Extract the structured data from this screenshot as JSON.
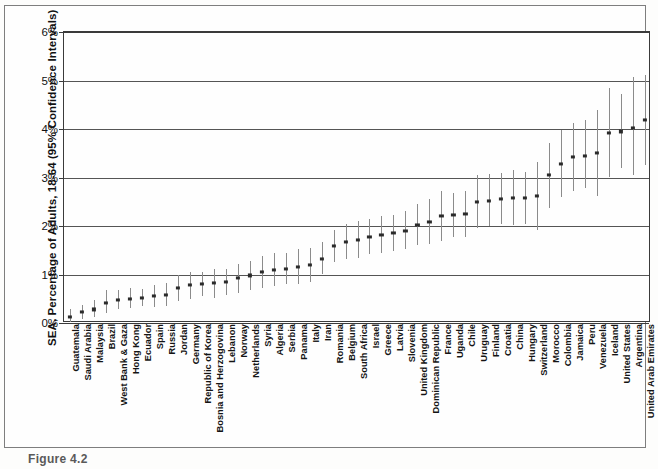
{
  "figure": {
    "caption": "Figure 4.2"
  },
  "chart_data": {
    "type": "scatter",
    "title": "",
    "subtitle": "",
    "xlabel": "",
    "ylabel": "SEA, Percentage of Adults, 18-64 (95% Confidence Intervals)",
    "ylim": [
      0,
      6
    ],
    "ytick_labels": [
      "0%",
      "1%",
      "2%",
      "3%",
      "4%",
      "5%",
      "6%"
    ],
    "ytick_values": [
      0,
      1,
      2,
      3,
      4,
      5,
      6
    ],
    "grid": true,
    "legend": null,
    "legend_position": "none",
    "units": "percent",
    "error_bar_type": "95% Confidence Intervals",
    "categories": [
      "Guatemala",
      "Saudi Arabia",
      "Malaysia",
      "Brazil",
      "West Bank & Gaza",
      "Hong Kong",
      "Ecuador",
      "Spain",
      "Russia",
      "Jordan",
      "Germany",
      "Republic of Korea",
      "Bosnia and Herzogovina",
      "Lebanon",
      "Norway",
      "Netherlands",
      "Syria",
      "Algeria",
      "Serbia",
      "Panama",
      "Italy",
      "Iran",
      "Romania",
      "Belgium",
      "South Africa",
      "Israel",
      "Greece",
      "Latvia",
      "Slovenia",
      "United Kingdom",
      "Dominican Republic",
      "France",
      "Uganda",
      "Chile",
      "Uruguay",
      "Finland",
      "Croatia",
      "China",
      "Hungary",
      "Switzerland",
      "Morocco",
      "Colombia",
      "Jamaica",
      "Peru",
      "Venezuela",
      "Iceland",
      "United States",
      "Argentina",
      "United Arab Emirates"
    ],
    "values": [
      0.13,
      0.22,
      0.28,
      0.42,
      0.47,
      0.5,
      0.52,
      0.55,
      0.58,
      0.72,
      0.78,
      0.8,
      0.82,
      0.85,
      0.92,
      0.98,
      1.05,
      1.1,
      1.12,
      1.15,
      1.2,
      1.33,
      1.58,
      1.68,
      1.72,
      1.78,
      1.82,
      1.85,
      1.9,
      2.02,
      2.08,
      2.2,
      2.22,
      2.25,
      2.5,
      2.52,
      2.55,
      2.58,
      2.58,
      2.62,
      3.05,
      3.28,
      3.42,
      3.45,
      3.5,
      3.92,
      3.95,
      4.02,
      4.18
    ],
    "ci_lower": [
      0.02,
      0.08,
      0.12,
      0.2,
      0.28,
      0.3,
      0.35,
      0.33,
      0.36,
      0.45,
      0.5,
      0.55,
      0.52,
      0.58,
      0.62,
      0.68,
      0.72,
      0.76,
      0.8,
      0.8,
      0.85,
      1.0,
      1.25,
      1.32,
      1.35,
      1.42,
      1.45,
      1.48,
      1.52,
      1.6,
      1.62,
      1.7,
      1.78,
      1.78,
      1.95,
      2.0,
      2.05,
      2.02,
      2.05,
      1.92,
      2.38,
      2.6,
      2.72,
      2.78,
      2.62,
      3.0,
      3.2,
      3.05,
      3.25
    ],
    "ci_upper": [
      0.28,
      0.38,
      0.48,
      0.68,
      0.68,
      0.72,
      0.7,
      0.78,
      0.82,
      1.0,
      1.05,
      1.05,
      1.12,
      1.12,
      1.22,
      1.28,
      1.38,
      1.45,
      1.45,
      1.52,
      1.55,
      1.68,
      1.92,
      2.05,
      2.1,
      2.15,
      2.2,
      2.22,
      2.3,
      2.45,
      2.55,
      2.72,
      2.68,
      2.72,
      3.05,
      3.08,
      3.1,
      3.15,
      3.12,
      3.32,
      3.72,
      3.98,
      4.12,
      4.18,
      4.4,
      4.85,
      4.72,
      5.08,
      5.12
    ]
  }
}
